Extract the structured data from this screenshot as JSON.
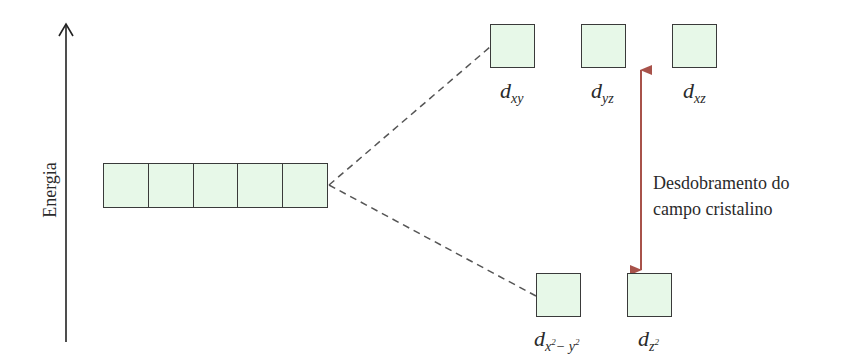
{
  "axis": {
    "label": "Energia"
  },
  "degenerate_set": {
    "count": 5
  },
  "upper_orbitals": [
    {
      "base": "d",
      "sub": "xy"
    },
    {
      "base": "d",
      "sub": "yz"
    },
    {
      "base": "d",
      "sub": "xz"
    }
  ],
  "lower_orbitals": [
    {
      "base": "d",
      "sub_main": "x",
      "sub_sup1": "2",
      "sub_mid": "− y",
      "sub_sup2": "2"
    },
    {
      "base": "d",
      "sub_main": "z",
      "sub_sup1": "2"
    }
  ],
  "splitting": {
    "line1": "Desdobramento do",
    "line2": "campo cristalino",
    "arrow_color": "#a8524a"
  },
  "colors": {
    "box_fill": "#e7f8e8",
    "box_border": "#3a3a3a",
    "dash": "#555555"
  }
}
